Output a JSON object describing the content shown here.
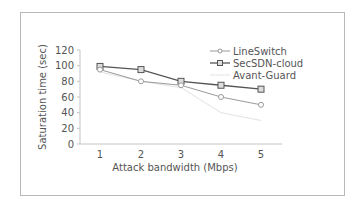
{
  "chart_data": {
    "type": "line",
    "title": "",
    "xlabel": "Attack bandwidth (Mbps)",
    "ylabel": "Saturation time (sec)",
    "x": [
      1,
      2,
      3,
      4,
      5
    ],
    "categories": [
      "1",
      "2",
      "3",
      "4",
      "5"
    ],
    "ylim": [
      0,
      120
    ],
    "yticks": [
      "0",
      "20",
      "40",
      "60",
      "80",
      "100",
      "120"
    ],
    "grid": false,
    "legend_position": "top-right",
    "series": [
      {
        "name": "LineSwitch",
        "values": [
          95,
          80,
          75,
          60,
          50
        ],
        "color": "#9a9a9a",
        "marker": "circle"
      },
      {
        "name": "SecSDN-cloud",
        "values": [
          99,
          95,
          80,
          75,
          70
        ],
        "color": "#555555",
        "marker": "square"
      },
      {
        "name": "Avant-Guard",
        "values": [
          92,
          80,
          72,
          40,
          30
        ],
        "color": "#e2e2e2",
        "marker": "none"
      }
    ]
  }
}
